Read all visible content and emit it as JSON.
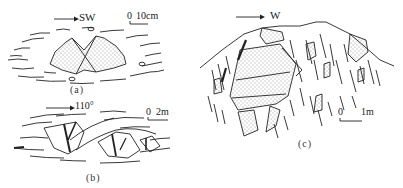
{
  "panels": [
    {
      "id": "a",
      "caption": "(a)",
      "direction_label": "SW",
      "scale_zero": "0",
      "scale_label": "10cm"
    },
    {
      "id": "b",
      "caption": "(b)",
      "direction_label": "110°",
      "scale_zero": "0",
      "scale_label": "2m"
    },
    {
      "id": "c",
      "caption": "(c)",
      "direction_label": "W",
      "scale_zero": "0",
      "scale_label": "1m"
    }
  ],
  "colors": {
    "ink": "#222222",
    "background": "#ffffff"
  }
}
